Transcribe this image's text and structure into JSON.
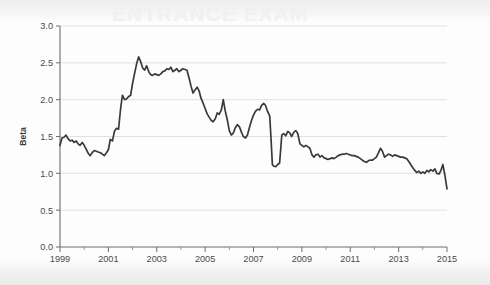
{
  "figure": {
    "background_color": "#fdfdfd",
    "watermark_text": "ENTRANCE EXAM"
  },
  "chart_data": {
    "type": "line",
    "title": "",
    "xlabel": "",
    "ylabel": "Beta",
    "xlim": [
      1999.0,
      2015.0
    ],
    "ylim": [
      0.0,
      3.0
    ],
    "grid": true,
    "grid_axis": "y",
    "legend": false,
    "line_color": "#3a3a3a",
    "yticks": [
      0.0,
      0.5,
      1.0,
      1.5,
      2.0,
      2.5,
      3.0
    ],
    "ytick_labels": [
      "0.0",
      "0.5",
      "1.0",
      "1.5",
      "2.0",
      "2.5",
      "3.0"
    ],
    "xticks": [
      1999,
      2001,
      2003,
      2005,
      2007,
      2009,
      2011,
      2013,
      2015
    ],
    "xtick_labels": [
      "1999",
      "2001",
      "2003",
      "2005",
      "2007",
      "2009",
      "2011",
      "2013",
      "2015"
    ],
    "xticks_minor": [
      2000,
      2002,
      2004,
      2006,
      2008,
      2010,
      2012,
      2014
    ],
    "series": [
      {
        "name": "Beta",
        "x": [
          1999.0,
          1999.08,
          1999.17,
          1999.25,
          1999.33,
          1999.42,
          1999.5,
          1999.58,
          1999.67,
          1999.75,
          1999.83,
          1999.92,
          2000.0,
          2000.08,
          2000.17,
          2000.25,
          2000.33,
          2000.42,
          2000.5,
          2000.58,
          2000.67,
          2000.75,
          2000.83,
          2000.92,
          2001.0,
          2001.08,
          2001.17,
          2001.25,
          2001.33,
          2001.42,
          2001.5,
          2001.58,
          2001.67,
          2001.75,
          2001.83,
          2001.92,
          2002.0,
          2002.08,
          2002.17,
          2002.25,
          2002.33,
          2002.42,
          2002.5,
          2002.58,
          2002.67,
          2002.75,
          2002.83,
          2002.92,
          2003.0,
          2003.08,
          2003.17,
          2003.25,
          2003.33,
          2003.42,
          2003.5,
          2003.58,
          2003.67,
          2003.75,
          2003.83,
          2003.92,
          2004.0,
          2004.08,
          2004.17,
          2004.25,
          2004.33,
          2004.42,
          2004.5,
          2004.58,
          2004.67,
          2004.75,
          2004.83,
          2004.92,
          2005.0,
          2005.08,
          2005.17,
          2005.25,
          2005.33,
          2005.42,
          2005.5,
          2005.58,
          2005.67,
          2005.75,
          2005.83,
          2005.92,
          2006.0,
          2006.08,
          2006.17,
          2006.25,
          2006.33,
          2006.42,
          2006.5,
          2006.58,
          2006.67,
          2006.75,
          2006.83,
          2006.92,
          2007.0,
          2007.08,
          2007.17,
          2007.25,
          2007.33,
          2007.42,
          2007.5,
          2007.58,
          2007.67,
          2007.72,
          2007.78,
          2007.83,
          2007.92,
          2008.0,
          2008.08,
          2008.17,
          2008.25,
          2008.33,
          2008.42,
          2008.5,
          2008.58,
          2008.67,
          2008.75,
          2008.83,
          2008.92,
          2009.0,
          2009.08,
          2009.17,
          2009.25,
          2009.33,
          2009.42,
          2009.5,
          2009.58,
          2009.67,
          2009.75,
          2009.83,
          2009.92,
          2010.0,
          2010.08,
          2010.17,
          2010.25,
          2010.33,
          2010.42,
          2010.5,
          2010.58,
          2010.67,
          2010.75,
          2010.83,
          2010.92,
          2011.0,
          2011.08,
          2011.17,
          2011.25,
          2011.33,
          2011.42,
          2011.5,
          2011.58,
          2011.67,
          2011.75,
          2011.83,
          2011.92,
          2012.0,
          2012.08,
          2012.17,
          2012.25,
          2012.33,
          2012.42,
          2012.5,
          2012.58,
          2012.67,
          2012.75,
          2012.83,
          2012.92,
          2013.0,
          2013.08,
          2013.17,
          2013.25,
          2013.33,
          2013.42,
          2013.5,
          2013.58,
          2013.67,
          2013.75,
          2013.83,
          2013.92,
          2014.0,
          2014.08,
          2014.17,
          2014.25,
          2014.33,
          2014.42,
          2014.5,
          2014.58,
          2014.67,
          2014.75,
          2014.83,
          2014.92,
          2015.0
        ],
        "values": [
          1.38,
          1.48,
          1.49,
          1.52,
          1.47,
          1.44,
          1.45,
          1.42,
          1.44,
          1.4,
          1.38,
          1.42,
          1.38,
          1.33,
          1.27,
          1.24,
          1.28,
          1.31,
          1.3,
          1.29,
          1.28,
          1.26,
          1.24,
          1.28,
          1.32,
          1.46,
          1.44,
          1.57,
          1.61,
          1.6,
          1.86,
          2.06,
          2.0,
          2.01,
          2.04,
          2.06,
          2.22,
          2.35,
          2.49,
          2.58,
          2.52,
          2.43,
          2.4,
          2.46,
          2.38,
          2.34,
          2.33,
          2.35,
          2.34,
          2.33,
          2.35,
          2.38,
          2.39,
          2.42,
          2.41,
          2.44,
          2.38,
          2.4,
          2.42,
          2.38,
          2.4,
          2.42,
          2.41,
          2.4,
          2.3,
          2.18,
          2.09,
          2.13,
          2.17,
          2.12,
          2.02,
          1.95,
          1.88,
          1.81,
          1.76,
          1.72,
          1.7,
          1.74,
          1.82,
          1.8,
          1.86,
          2.0,
          1.85,
          1.72,
          1.58,
          1.52,
          1.55,
          1.62,
          1.66,
          1.63,
          1.56,
          1.5,
          1.48,
          1.52,
          1.62,
          1.72,
          1.79,
          1.84,
          1.87,
          1.86,
          1.92,
          1.95,
          1.92,
          1.84,
          1.78,
          1.5,
          1.12,
          1.1,
          1.09,
          1.12,
          1.14,
          1.52,
          1.54,
          1.51,
          1.57,
          1.55,
          1.5,
          1.56,
          1.58,
          1.54,
          1.4,
          1.38,
          1.36,
          1.38,
          1.36,
          1.34,
          1.25,
          1.22,
          1.25,
          1.26,
          1.22,
          1.24,
          1.21,
          1.2,
          1.19,
          1.2,
          1.21,
          1.2,
          1.22,
          1.24,
          1.25,
          1.26,
          1.26,
          1.27,
          1.26,
          1.25,
          1.24,
          1.24,
          1.23,
          1.22,
          1.2,
          1.18,
          1.16,
          1.15,
          1.17,
          1.18,
          1.18,
          1.2,
          1.22,
          1.28,
          1.34,
          1.3,
          1.22,
          1.24,
          1.26,
          1.25,
          1.23,
          1.25,
          1.24,
          1.23,
          1.22,
          1.22,
          1.21,
          1.2,
          1.16,
          1.12,
          1.08,
          1.04,
          1.01,
          1.03,
          1.0,
          1.02,
          1.0,
          1.04,
          1.02,
          1.05,
          1.03,
          1.06,
          1.0,
          0.99,
          1.04,
          1.12,
          0.96,
          0.79
        ]
      }
    ]
  }
}
